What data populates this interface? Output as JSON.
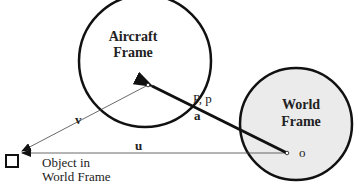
{
  "aircraft_frame": {
    "title_line1": "Aircraft",
    "title_line2": "Frame",
    "origin_label": "o"
  },
  "world_frame": {
    "title_line1": "World",
    "title_line2": "Frame",
    "origin_label": "o",
    "fill": "#ebebeb"
  },
  "vectors": {
    "a": "a",
    "u": "u",
    "v": "v",
    "position_label": "P, p"
  },
  "object": {
    "label_line1": "Object in",
    "label_line2": "World Frame"
  }
}
